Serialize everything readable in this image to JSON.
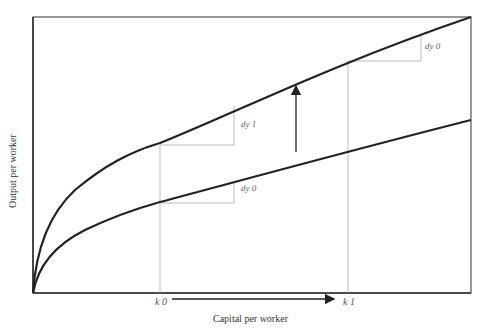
{
  "diagram": {
    "type": "production function shift (Solow growth diagram)",
    "x_axis": {
      "label": "Capital per worker",
      "ticks": [
        "k 0",
        "k 1"
      ]
    },
    "y_axis": {
      "label": "Output per worker"
    },
    "curves": [
      {
        "name": "upper production function",
        "description": "higher output curve after technology shift"
      },
      {
        "name": "lower production function",
        "description": "original output curve"
      }
    ],
    "slope_labels": {
      "dy1": "dy 1",
      "dy0_lower": "dy 0",
      "dy0_upper": "dy 0"
    },
    "arrows": [
      {
        "name": "upward shift arrow",
        "direction": "up"
      },
      {
        "name": "capital increase arrow",
        "direction": "right",
        "from": "k 0",
        "to": "k 1"
      }
    ]
  }
}
